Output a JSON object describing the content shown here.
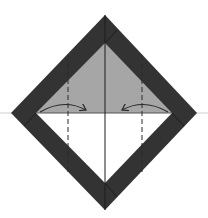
{
  "diagram": {
    "type": "origami-fold-step",
    "colors": {
      "border": "#333333",
      "upper_fill": "#a6a6a6",
      "lower_fill": "#ffffff",
      "lines": "#2a2a2a",
      "baseline": "#cfcfcf"
    },
    "shapes": {
      "outer_diamond": [
        [
          105,
          15
        ],
        [
          197,
          113
        ],
        [
          105,
          210
        ],
        [
          11,
          113
        ]
      ],
      "inner_diamond": [
        [
          105,
          43
        ],
        [
          172,
          113
        ],
        [
          105,
          183
        ],
        [
          36,
          113
        ]
      ]
    },
    "lines": {
      "horizontal_baseline_y": 113,
      "center_vertical_x": 105,
      "dashed_fold_lines_x": [
        68,
        142
      ]
    },
    "arrows": [
      {
        "name": "left-fold-arrow",
        "from": [
          40,
          112
        ],
        "to": [
          86,
          110
        ],
        "direction": "right"
      },
      {
        "name": "right-fold-arrow",
        "from": [
          168,
          112
        ],
        "to": [
          122,
          110
        ],
        "direction": "left"
      }
    ]
  }
}
